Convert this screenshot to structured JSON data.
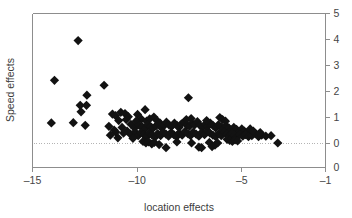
{
  "chart_data": {
    "type": "scatter",
    "title": "",
    "xlabel": "location effects",
    "ylabel": "Speed effects",
    "xlim": [
      -15,
      -1
    ],
    "ylim": [
      0,
      5
    ],
    "xticks": [
      -15,
      -10,
      -5,
      -1
    ],
    "xtick_labels": [
      "–15",
      "–10",
      "–5",
      "–1"
    ],
    "yticks": [
      0,
      1,
      2,
      3,
      4,
      5
    ],
    "ytick_labels": [
      "0",
      "1",
      "2",
      "3",
      "4",
      "5"
    ],
    "y_axis_position": "right",
    "extra_ytick_label": "0",
    "grid": false,
    "legend": null,
    "reference_line": {
      "orientation": "horizontal",
      "y": 0,
      "style": "dotted",
      "color": "#b4b4b4"
    },
    "marker": {
      "shape": "diamond",
      "color": "#121212",
      "size": 4.6
    },
    "points": [
      [
        -12.82,
        3.96
      ],
      [
        -13.95,
        2.43
      ],
      [
        -11.58,
        2.24
      ],
      [
        -12.4,
        1.86
      ],
      [
        -7.55,
        1.76
      ],
      [
        -12.72,
        1.47
      ],
      [
        -12.42,
        1.47
      ],
      [
        -12.68,
        1.22
      ],
      [
        -9.62,
        1.3
      ],
      [
        -11.18,
        1.13
      ],
      [
        -11.03,
        1.07
      ],
      [
        -10.78,
        1.2
      ],
      [
        -10.58,
        1.15
      ],
      [
        -10.42,
        1.03
      ],
      [
        -9.98,
        1.12
      ],
      [
        -9.8,
        0.94
      ],
      [
        -9.55,
        0.86
      ],
      [
        -9.4,
        0.95
      ],
      [
        -9.2,
        1.02
      ],
      [
        -9.05,
        0.88
      ],
      [
        -8.9,
        0.78
      ],
      [
        -14.1,
        0.79
      ],
      [
        -13.05,
        0.8
      ],
      [
        -12.48,
        0.7
      ],
      [
        -11.35,
        0.66
      ],
      [
        -10.72,
        0.62
      ],
      [
        -10.3,
        0.74
      ],
      [
        -10.12,
        0.6
      ],
      [
        -10.05,
        0.86
      ],
      [
        -9.9,
        0.7
      ],
      [
        -9.75,
        0.64
      ],
      [
        -9.62,
        0.56
      ],
      [
        -9.5,
        0.72
      ],
      [
        -9.35,
        0.65
      ],
      [
        -9.25,
        0.58
      ],
      [
        -9.1,
        0.68
      ],
      [
        -8.98,
        0.75
      ],
      [
        -8.85,
        0.62
      ],
      [
        -8.7,
        0.7
      ],
      [
        -8.6,
        0.82
      ],
      [
        -8.48,
        0.72
      ],
      [
        -8.35,
        0.66
      ],
      [
        -8.22,
        0.78
      ],
      [
        -8.1,
        0.7
      ],
      [
        -8.0,
        0.62
      ],
      [
        -7.88,
        0.76
      ],
      [
        -7.75,
        0.82
      ],
      [
        -7.62,
        0.7
      ],
      [
        -7.5,
        0.66
      ],
      [
        -7.38,
        0.78
      ],
      [
        -7.25,
        0.72
      ],
      [
        -7.12,
        0.84
      ],
      [
        -7.0,
        0.7
      ],
      [
        -6.88,
        0.62
      ],
      [
        -6.75,
        0.74
      ],
      [
        -6.62,
        0.66
      ],
      [
        -6.5,
        0.78
      ],
      [
        -6.38,
        0.7
      ],
      [
        -6.25,
        0.6
      ],
      [
        -6.12,
        0.72
      ],
      [
        -6.0,
        0.64
      ],
      [
        -5.88,
        0.56
      ],
      [
        -5.75,
        0.68
      ],
      [
        -5.62,
        0.6
      ],
      [
        -5.5,
        0.52
      ],
      [
        -5.38,
        0.62
      ],
      [
        -5.25,
        0.54
      ],
      [
        -5.12,
        0.46
      ],
      [
        -5.0,
        0.56
      ],
      [
        -4.88,
        0.48
      ],
      [
        -4.75,
        0.4
      ],
      [
        -10.48,
        0.48
      ],
      [
        -10.32,
        0.36
      ],
      [
        -10.1,
        0.44
      ],
      [
        -9.95,
        0.3
      ],
      [
        -9.82,
        0.42
      ],
      [
        -9.68,
        0.34
      ],
      [
        -9.55,
        0.26
      ],
      [
        -9.42,
        0.4
      ],
      [
        -9.28,
        0.32
      ],
      [
        -9.15,
        0.24
      ],
      [
        -9.02,
        0.38
      ],
      [
        -8.88,
        0.3
      ],
      [
        -8.75,
        0.44
      ],
      [
        -8.62,
        0.36
      ],
      [
        -8.5,
        0.28
      ],
      [
        -8.38,
        0.42
      ],
      [
        -8.25,
        0.34
      ],
      [
        -8.12,
        0.26
      ],
      [
        -8.0,
        0.4
      ],
      [
        -7.85,
        0.32
      ],
      [
        -7.72,
        0.46
      ],
      [
        -7.58,
        0.38
      ],
      [
        -7.45,
        0.3
      ],
      [
        -7.32,
        0.44
      ],
      [
        -7.18,
        0.36
      ],
      [
        -7.05,
        0.28
      ],
      [
        -6.92,
        0.42
      ],
      [
        -6.78,
        0.34
      ],
      [
        -6.65,
        0.48
      ],
      [
        -6.52,
        0.4
      ],
      [
        -6.38,
        0.32
      ],
      [
        -6.25,
        0.26
      ],
      [
        -6.1,
        0.38
      ],
      [
        -5.98,
        0.3
      ],
      [
        -5.85,
        0.44
      ],
      [
        -5.72,
        0.36
      ],
      [
        -5.6,
        0.28
      ],
      [
        -5.48,
        0.4
      ],
      [
        -5.35,
        0.32
      ],
      [
        -5.22,
        0.24
      ],
      [
        -5.1,
        0.36
      ],
      [
        -4.95,
        0.28
      ],
      [
        -4.82,
        0.34
      ],
      [
        -4.68,
        0.26
      ],
      [
        -4.52,
        0.3
      ],
      [
        -4.35,
        0.38
      ],
      [
        -4.2,
        0.26
      ],
      [
        -4.05,
        0.32
      ],
      [
        -3.85,
        0.28
      ],
      [
        -3.6,
        0.3
      ],
      [
        -11.02,
        0.44
      ],
      [
        -10.92,
        0.22
      ],
      [
        -10.2,
        0.2
      ],
      [
        -9.72,
        0.08
      ],
      [
        -9.58,
        0.02
      ],
      [
        -9.45,
        0.06
      ],
      [
        -9.3,
        -0.02
      ],
      [
        -9.18,
        0.04
      ],
      [
        -8.95,
        -0.04
      ],
      [
        -8.62,
        -0.16
      ],
      [
        -8.1,
        0.06
      ],
      [
        -7.4,
        0.02
      ],
      [
        -7.05,
        -0.14
      ],
      [
        -6.92,
        -0.16
      ],
      [
        -6.55,
        0.04
      ],
      [
        -6.42,
        -0.12
      ],
      [
        -6.28,
        -0.06
      ],
      [
        -6.15,
        0.02
      ],
      [
        -5.7,
        0.16
      ],
      [
        -5.58,
        0.12
      ],
      [
        -5.45,
        0.08
      ],
      [
        -5.32,
        0.14
      ],
      [
        -5.2,
        0.1
      ],
      [
        -3.28,
        0.02
      ],
      [
        -11.28,
        0.32
      ],
      [
        -11.1,
        0.52
      ],
      [
        -10.88,
        0.88
      ],
      [
        -10.65,
        0.4
      ],
      [
        -10.52,
        0.92
      ],
      [
        -6.05,
        1.0
      ],
      [
        -5.92,
        0.92
      ],
      [
        -5.78,
        0.86
      ],
      [
        -4.6,
        0.56
      ],
      [
        -4.45,
        0.48
      ],
      [
        -4.12,
        0.42
      ],
      [
        -7.65,
        0.92
      ],
      [
        -7.42,
        0.96
      ],
      [
        -6.68,
        0.88
      ]
    ]
  }
}
